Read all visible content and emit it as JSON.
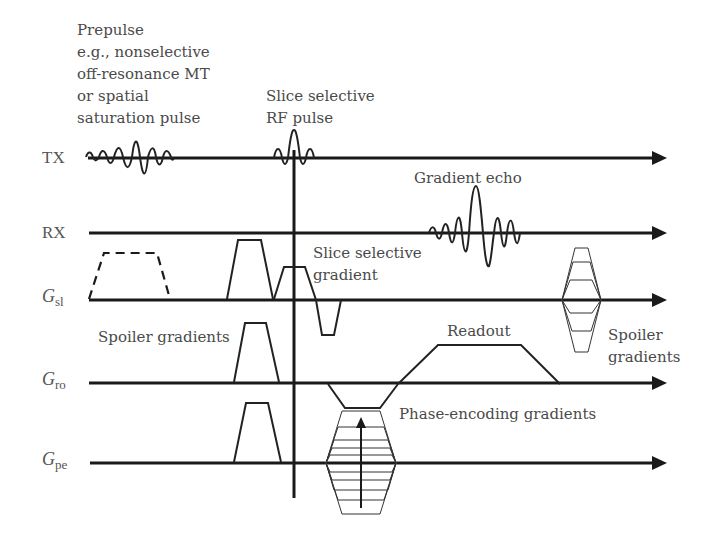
{
  "axes": [
    {
      "id": "tx",
      "label": "TX",
      "subscript": ""
    },
    {
      "id": "rx",
      "label": "RX",
      "subscript": ""
    },
    {
      "id": "gsl",
      "label": "G",
      "subscript": "sl"
    },
    {
      "id": "gro",
      "label": "G",
      "subscript": "ro"
    },
    {
      "id": "gpe",
      "label": "G",
      "subscript": "pe"
    }
  ],
  "annotations": {
    "prepulse": [
      "Prepulse",
      "e.g., nonselective",
      "off-resonance MT",
      "or spatial",
      "saturation pulse"
    ],
    "rf_pulse": [
      "Slice selective",
      "RF pulse"
    ],
    "gradient_echo": "Gradient echo",
    "slice_gradient": [
      "Slice selective",
      "gradient"
    ],
    "spoiler_left": "Spoiler gradients",
    "readout": "Readout",
    "spoiler_right": [
      "Spoiler",
      "gradients"
    ],
    "phase_encoding": "Phase-encoding gradients"
  },
  "colors": {
    "line": "#1a1a1a",
    "text": "#4a4a4a",
    "background": "#ffffff"
  }
}
